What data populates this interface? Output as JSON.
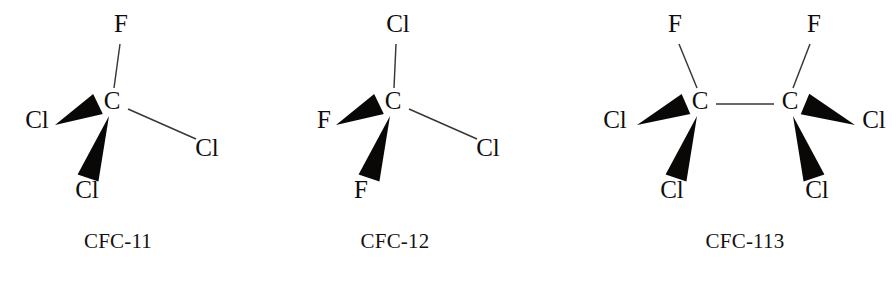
{
  "figure": {
    "background_color": "#ffffff",
    "bond_color": "#3a3634",
    "wedge_color": "#0a0807",
    "text_color": "#100d0c",
    "width": 896,
    "height": 289
  },
  "molecules": [
    {
      "id": "cfc-11",
      "caption": "CFC-11",
      "formula": "CCl3F",
      "caption_x": 118,
      "caption_y": 248,
      "carbons": [
        {
          "id": "c1",
          "label": "C",
          "x": 112,
          "y": 109
        }
      ],
      "substituents": [
        {
          "id": "f-top",
          "label": "F",
          "label_x": 121,
          "label_y": 32,
          "bond_type": "line",
          "bond": {
            "x1": 120,
            "y1": 44,
            "x2": 114,
            "y2": 88
          }
        },
        {
          "id": "cl-left",
          "label": "Cl",
          "label_x": 37,
          "label_y": 128,
          "bond_type": "wedge",
          "wedge": {
            "tip_x": 55,
            "tip_y": 125,
            "base_x": 98,
            "base_y": 104,
            "base_half_width": 11
          }
        },
        {
          "id": "cl-bottom",
          "label": "Cl",
          "label_x": 87,
          "label_y": 198,
          "bond_type": "wedge",
          "wedge": {
            "tip_x": 109,
            "tip_y": 116,
            "base_x": 88,
            "base_y": 178,
            "base_half_width": 11
          }
        },
        {
          "id": "cl-right",
          "label": "Cl",
          "label_x": 207,
          "label_y": 156,
          "bond_type": "line",
          "bond": {
            "x1": 128,
            "y1": 109,
            "x2": 196,
            "y2": 139
          }
        }
      ]
    },
    {
      "id": "cfc-12",
      "caption": "CFC-12",
      "formula": "CCl2F2",
      "caption_x": 395,
      "caption_y": 248,
      "carbons": [
        {
          "id": "c1",
          "label": "C",
          "x": 393,
          "y": 109
        }
      ],
      "substituents": [
        {
          "id": "cl-top",
          "label": "Cl",
          "label_x": 398,
          "label_y": 32,
          "bond_type": "line",
          "bond": {
            "x1": 396,
            "y1": 44,
            "x2": 394,
            "y2": 88
          }
        },
        {
          "id": "f-left",
          "label": "F",
          "label_x": 324,
          "label_y": 128,
          "bond_type": "wedge",
          "wedge": {
            "tip_x": 336,
            "tip_y": 125,
            "base_x": 379,
            "base_y": 104,
            "base_half_width": 11
          }
        },
        {
          "id": "f-bottom",
          "label": "F",
          "label_x": 361,
          "label_y": 198,
          "bond_type": "wedge",
          "wedge": {
            "tip_x": 390,
            "tip_y": 116,
            "base_x": 369,
            "base_y": 178,
            "base_half_width": 11
          }
        },
        {
          "id": "cl-right",
          "label": "Cl",
          "label_x": 488,
          "label_y": 156,
          "bond_type": "line",
          "bond": {
            "x1": 409,
            "y1": 109,
            "x2": 477,
            "y2": 139
          }
        }
      ]
    },
    {
      "id": "cfc-113",
      "caption": "CFC-113",
      "formula": "C2Cl3F3",
      "caption_x": 745,
      "caption_y": 248,
      "carbons": [
        {
          "id": "c1",
          "label": "C",
          "x": 700,
          "y": 109
        },
        {
          "id": "c2",
          "label": "C",
          "x": 790,
          "y": 109
        }
      ],
      "substituents": [
        {
          "id": "f-top-left",
          "label": "F",
          "label_x": 675,
          "label_y": 32,
          "bond_type": "line",
          "bond": {
            "x1": 679,
            "y1": 44,
            "x2": 697,
            "y2": 88
          }
        },
        {
          "id": "cl-left",
          "label": "Cl",
          "label_x": 615,
          "label_y": 128,
          "bond_type": "wedge",
          "wedge": {
            "tip_x": 637,
            "tip_y": 125,
            "base_x": 686,
            "base_y": 104,
            "base_half_width": 11
          }
        },
        {
          "id": "cl-bottom-left",
          "label": "Cl",
          "label_x": 672,
          "label_y": 198,
          "bond_type": "wedge",
          "wedge": {
            "tip_x": 697,
            "tip_y": 116,
            "base_x": 676,
            "base_y": 178,
            "base_half_width": 11
          }
        },
        {
          "id": "f-top-right",
          "label": "F",
          "label_x": 814,
          "label_y": 32,
          "bond_type": "line",
          "bond": {
            "x1": 810,
            "y1": 44,
            "x2": 793,
            "y2": 88
          }
        },
        {
          "id": "cl-right",
          "label": "Cl",
          "label_x": 874,
          "label_y": 128,
          "bond_type": "wedge",
          "wedge": {
            "tip_x": 855,
            "tip_y": 125,
            "base_x": 805,
            "base_y": 104,
            "base_half_width": 11
          }
        },
        {
          "id": "cl-bottom-right",
          "label": "Cl",
          "label_x": 817,
          "label_y": 198,
          "bond_type": "wedge",
          "wedge": {
            "tip_x": 793,
            "tip_y": 116,
            "base_x": 814,
            "base_y": 178,
            "base_half_width": 11
          }
        }
      ],
      "backbone_bonds": [
        {
          "id": "c1-c2",
          "x1": 716,
          "y1": 104,
          "x2": 774,
          "y2": 104
        }
      ]
    }
  ]
}
